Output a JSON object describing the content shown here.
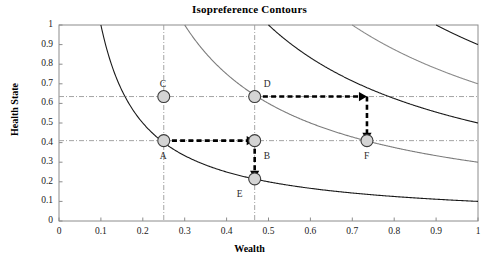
{
  "chart_data": {
    "type": "line",
    "title": "Isopreference Contours",
    "xlabel": "Wealth",
    "ylabel": "Health State",
    "xlim": [
      0,
      1
    ],
    "ylim": [
      0,
      1
    ],
    "grid": false,
    "legend": "none",
    "xticks": [
      "0",
      "0.1",
      "0.2",
      "0.3",
      "0.4",
      "0.5",
      "0.6",
      "0.7",
      "0.8",
      "0.9",
      "1"
    ],
    "xtick_values": [
      0,
      0.1,
      0.2,
      0.3,
      0.4,
      0.5,
      0.6,
      0.7,
      0.8,
      0.9,
      1
    ],
    "yticks": [
      "0",
      "0.1",
      "0.2",
      "0.3",
      "0.4",
      "0.5",
      "0.6",
      "0.7",
      "0.8",
      "0.9",
      "1"
    ],
    "ytick_values": [
      0,
      0.1,
      0.2,
      0.3,
      0.4,
      0.5,
      0.6,
      0.7,
      0.8,
      0.9,
      1
    ],
    "curve_family": "xy = k (isopreference hyperbolas)",
    "series": [
      {
        "name": "k = 0.10",
        "k": 0.1,
        "color": "#1a1a1a",
        "y_at_x1": 0.1,
        "x_at_y1": 0.1
      },
      {
        "name": "k = 0.30",
        "k": 0.3,
        "color": "#7d7d7d",
        "y_at_x1": 0.3,
        "x_at_y1": 0.3
      },
      {
        "name": "k = 0.50",
        "k": 0.5,
        "color": "#1a1a1a",
        "y_at_x1": 0.5,
        "x_at_y1": 0.5
      },
      {
        "name": "k = 0.70",
        "k": 0.7,
        "color": "#8a8a8a",
        "y_at_x1": 0.7,
        "x_at_y1": 0.7
      },
      {
        "name": "k = 0.90",
        "k": 0.9,
        "color": "#1a1a1a",
        "y_at_x1": 0.9,
        "x_at_y1": 0.9
      }
    ],
    "points": [
      {
        "label": "A",
        "x": 0.25,
        "y": 0.41,
        "label_dx": -4,
        "label_dy": 16
      },
      {
        "label": "B",
        "x": 0.467,
        "y": 0.41,
        "label_dx": 9,
        "label_dy": 16
      },
      {
        "label": "C",
        "x": 0.25,
        "y": 0.635,
        "label_dx": -4,
        "label_dy": -12
      },
      {
        "label": "D",
        "x": 0.467,
        "y": 0.635,
        "label_dx": 9,
        "label_dy": -12
      },
      {
        "label": "E",
        "x": 0.467,
        "y": 0.215,
        "label_dx": -18,
        "label_dy": 16
      },
      {
        "label": "F",
        "x": 0.735,
        "y": 0.41,
        "label_dx": -3,
        "label_dy": 16
      }
    ],
    "reference_lines": [
      {
        "orientation": "horizontal",
        "value": 0.41,
        "style": "dash-dot"
      },
      {
        "orientation": "horizontal",
        "value": 0.635,
        "style": "dash-dot"
      },
      {
        "orientation": "vertical",
        "value": 0.25,
        "style": "dash-dot"
      },
      {
        "orientation": "vertical",
        "value": 0.467,
        "style": "dash-dot"
      }
    ],
    "annotation_arrows": [
      {
        "from": {
          "x": 0.25,
          "y": 0.41
        },
        "to": {
          "x": 0.467,
          "y": 0.41
        },
        "direction": "right"
      },
      {
        "from": {
          "x": 0.467,
          "y": 0.41
        },
        "to": {
          "x": 0.467,
          "y": 0.215
        },
        "direction": "down"
      },
      {
        "from": {
          "x": 0.467,
          "y": 0.635
        },
        "to": {
          "x": 0.735,
          "y": 0.635
        },
        "direction": "right"
      },
      {
        "from": {
          "x": 0.735,
          "y": 0.635
        },
        "to": {
          "x": 0.735,
          "y": 0.41
        },
        "direction": "down"
      }
    ],
    "point_marker": {
      "fill": "#d4d4d4",
      "stroke": "#3a3a3a",
      "radius": 6
    },
    "axis_color": "#8c8c8c"
  }
}
